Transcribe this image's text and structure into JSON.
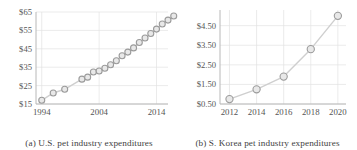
{
  "figure": {
    "background": "#ffffff",
    "marker_stroke": "#9b9b9b",
    "marker_fill": "#e8e8e8",
    "line_color": "#cfcfcf",
    "grid_color": "#e3e3e3",
    "axis_color": "#b8b8b8",
    "tick_color": "#555555"
  },
  "panels": [
    {
      "id": "panel-a",
      "caption": "(a) U.S. pet industry expenditures",
      "chart_data": {
        "type": "line",
        "title": "U.S. pet industry expenditures",
        "xlabel": "",
        "ylabel": "",
        "grid": true,
        "legend": "none",
        "xlim": [
          1993,
          2016
        ],
        "ylim": [
          15,
          65
        ],
        "xticks": [
          1994,
          2004,
          2014
        ],
        "xticklabels": [
          "1994",
          "2004",
          "2014"
        ],
        "yticks": [
          15,
          25,
          35,
          45,
          55,
          65
        ],
        "yticklabels": [
          "$15",
          "$25",
          "$35",
          "$45",
          "$55",
          "$65"
        ],
        "x": [
          1994,
          1996,
          1998,
          2001,
          2002,
          2003,
          2004,
          2005,
          2006,
          2007,
          2008,
          2009,
          2010,
          2011,
          2012,
          2013,
          2014,
          2015
        ],
        "values": [
          17.0,
          21.0,
          23.0,
          28.5,
          29.5,
          32.4,
          34.4,
          36.3,
          38.5,
          41.2,
          43.2,
          45.5,
          48.4,
          50.9,
          53.3,
          55.7,
          58.5,
          60.6,
          62.8
        ],
        "series": [
          {
            "name": "U.S. pet industry expenditures",
            "points": [
              {
                "x": 1994,
                "y": 17.0
              },
              {
                "x": 1996,
                "y": 21.0
              },
              {
                "x": 1998,
                "y": 23.0
              },
              {
                "x": 2001,
                "y": 28.5
              },
              {
                "x": 2002,
                "y": 29.6
              },
              {
                "x": 2003,
                "y": 32.4
              },
              {
                "x": 2004,
                "y": 32.9
              },
              {
                "x": 2005,
                "y": 34.4
              },
              {
                "x": 2006,
                "y": 36.3
              },
              {
                "x": 2007,
                "y": 38.5
              },
              {
                "x": 2008,
                "y": 41.2
              },
              {
                "x": 2009,
                "y": 43.2
              },
              {
                "x": 2010,
                "y": 45.5
              },
              {
                "x": 2011,
                "y": 48.4
              },
              {
                "x": 2012,
                "y": 50.9
              },
              {
                "x": 2013,
                "y": 53.3
              },
              {
                "x": 2014,
                "y": 55.7
              },
              {
                "x": 2015,
                "y": 58.5
              },
              {
                "x": 2016,
                "y": 60.6
              },
              {
                "x": 2017,
                "y": 62.8
              }
            ]
          }
        ]
      }
    },
    {
      "id": "panel-b",
      "caption": "(b) S. Korea pet industry expenditures",
      "chart_data": {
        "type": "line",
        "title": "S. Korea pet industry expenditures",
        "xlabel": "",
        "ylabel": "",
        "grid": true,
        "legend": "none",
        "xlim": [
          2011.3,
          2020.6
        ],
        "ylim": [
          0.5,
          5.3
        ],
        "xticks": [
          2012,
          2014,
          2016,
          2018,
          2020
        ],
        "xticklabels": [
          "2012",
          "2014",
          "2016",
          "2018",
          "2020"
        ],
        "yticks": [
          0.5,
          1.5,
          2.5,
          3.5,
          4.5
        ],
        "yticklabels": [
          "$0.50",
          "$1.50",
          "$2.50",
          "$3.50",
          "$4.50"
        ],
        "x": [
          2012,
          2014,
          2016,
          2018,
          2020
        ],
        "values": [
          0.75,
          1.25,
          1.9,
          3.3,
          5.0
        ],
        "series": [
          {
            "name": "S. Korea pet industry expenditures",
            "points": [
              {
                "x": 2012,
                "y": 0.75
              },
              {
                "x": 2014,
                "y": 1.25
              },
              {
                "x": 2016,
                "y": 1.9
              },
              {
                "x": 2018,
                "y": 3.3
              },
              {
                "x": 2020,
                "y": 5.0
              }
            ]
          }
        ]
      }
    }
  ]
}
